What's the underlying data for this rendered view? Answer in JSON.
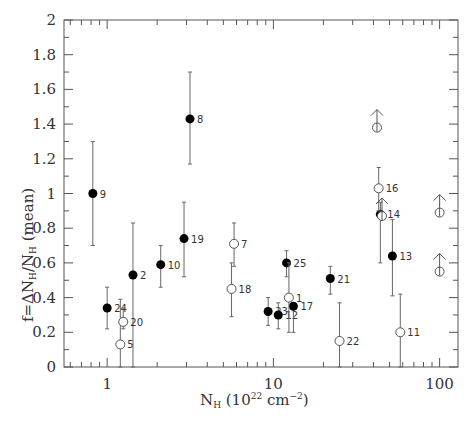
{
  "chart_data": {
    "type": "scatter",
    "title": "",
    "xlabel": "N_H (10^22 cm^-2)",
    "ylabel": "f = ΔN_H / N_H (mean)",
    "xscale": "log",
    "xlim": [
      0.55,
      129
    ],
    "ylim": [
      0,
      2
    ],
    "x_ticks": [
      1,
      10,
      100
    ],
    "x_tick_labels": [
      "1",
      "10",
      "100"
    ],
    "y_ticks": [
      0,
      0.2,
      0.4,
      0.6,
      0.8,
      1,
      1.2,
      1.4,
      1.6,
      1.8,
      2
    ],
    "y_tick_labels": [
      "0",
      "0.2",
      "0.4",
      "0.6",
      "0.8",
      "1",
      "1.2",
      "1.4",
      "1.6",
      "1.8",
      "2"
    ],
    "grid": false,
    "legend": null,
    "series": [
      {
        "name": "filled",
        "marker": "filled-circle",
        "points": [
          {
            "label": "9",
            "x": 0.82,
            "y": 1.0,
            "ylo": 0.7,
            "yhi": 1.3
          },
          {
            "label": "24",
            "x": 1.0,
            "y": 0.34,
            "ylo": 0.22,
            "yhi": 0.46
          },
          {
            "label": "2",
            "x": 1.43,
            "y": 0.53,
            "ylo": 0.0,
            "yhi": 0.83
          },
          {
            "label": "10",
            "x": 2.1,
            "y": 0.59,
            "ylo": 0.46,
            "yhi": 0.7
          },
          {
            "label": "19",
            "x": 2.9,
            "y": 0.74,
            "ylo": 0.52,
            "yhi": 0.95
          },
          {
            "label": "8",
            "x": 3.15,
            "y": 1.43,
            "ylo": 1.17,
            "yhi": 1.7
          },
          {
            "label": "23",
            "x": 9.3,
            "y": 0.32,
            "ylo": 0.24,
            "yhi": 0.4
          },
          {
            "label": "12",
            "x": 10.7,
            "y": 0.3,
            "ylo": 0.22,
            "yhi": 0.37
          },
          {
            "label": "17",
            "x": 13.2,
            "y": 0.35,
            "ylo": 0.2,
            "yhi": 0.35
          },
          {
            "label": "25",
            "x": 12.0,
            "y": 0.6,
            "ylo": 0.52,
            "yhi": 0.67
          },
          {
            "label": "21",
            "x": 22.0,
            "y": 0.51,
            "ylo": 0.42,
            "yhi": 0.58
          },
          {
            "label": "14",
            "x": 44.0,
            "y": 0.88,
            "ylo": 0.6,
            "yhi": 0.95
          },
          {
            "label": "13",
            "x": 52.0,
            "y": 0.64,
            "ylo": 0.41,
            "yhi": 0.85
          }
        ]
      },
      {
        "name": "open",
        "marker": "open-circle",
        "points": [
          {
            "label": "5",
            "x": 1.2,
            "y": 0.13,
            "ylo": 0.0,
            "yhi": 0.39
          },
          {
            "label": "20",
            "x": 1.25,
            "y": 0.26,
            "ylo": 0.22,
            "yhi": 0.34
          },
          {
            "label": "7",
            "x": 5.8,
            "y": 0.71,
            "ylo": 0.58,
            "yhi": 0.83
          },
          {
            "label": "18",
            "x": 5.6,
            "y": 0.45,
            "ylo": 0.29,
            "yhi": 0.6
          },
          {
            "label": "1",
            "x": 12.4,
            "y": 0.4,
            "ylo": 0.2,
            "yhi": 0.6
          },
          {
            "label": "22",
            "x": 25.0,
            "y": 0.15,
            "ylo": 0.0,
            "yhi": 0.37
          },
          {
            "label": "16",
            "x": 43.0,
            "y": 1.03,
            "ylo": 0.9,
            "yhi": 1.15
          },
          {
            "label": "11",
            "x": 58.0,
            "y": 0.2,
            "ylo": 0.0,
            "yhi": 0.42
          }
        ]
      },
      {
        "name": "lower-limits",
        "marker": "open-circle-up-arrow",
        "points": [
          {
            "label": "",
            "x": 42.0,
            "y": 1.38
          },
          {
            "label": "",
            "x": 45.0,
            "y": 0.87
          },
          {
            "label": "",
            "x": 100.0,
            "y": 0.89
          },
          {
            "label": "",
            "x": 100.0,
            "y": 0.55
          }
        ]
      }
    ]
  }
}
